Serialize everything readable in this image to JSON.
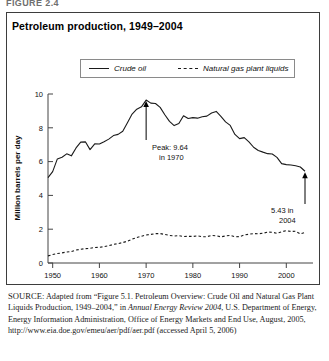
{
  "figure_label": "FIGURE 2.4",
  "chart_title": "Petroleum production, 1949–2004",
  "legend": {
    "items": [
      {
        "label": "Crude oil",
        "style": "solid"
      },
      {
        "label": "Natural gas plant liquids",
        "style": "dashed"
      }
    ]
  },
  "annotations": {
    "peak_line1": "Peak: 9.64",
    "peak_line2": "in 1970",
    "end_line1": "5.43 in",
    "end_line2": "2004"
  },
  "source": {
    "prefix": "SOURCE:",
    "part1": " Adapted from “Figure 5.1. Petroleum Overview: Crude Oil and Natural Gas Plant Liquids Production, 1949–2004,” in ",
    "italic1": "Annual Energy Review 2004",
    "part2": ", U.S. Department of Energy, Energy Information Administration, Office of Energy Markets and End Use, August, 2005, http://www.eia.doe.gov/emeu/aer/pdf/aer.pdf (accessed April 5, 2006)"
  },
  "chart_data": {
    "type": "line",
    "title": "Petroleum production, 1949–2004",
    "xlabel": "",
    "ylabel": "Million barrels per day",
    "xlim": [
      1949,
      2004
    ],
    "ylim": [
      0,
      10
    ],
    "yticks": [
      0,
      2,
      4,
      6,
      8,
      10
    ],
    "xticks": [
      1950,
      1960,
      1970,
      1980,
      1990,
      2000
    ],
    "grid": false,
    "legend_position": "top-center",
    "x": [
      1949,
      1950,
      1951,
      1952,
      1953,
      1954,
      1955,
      1956,
      1957,
      1958,
      1959,
      1960,
      1961,
      1962,
      1963,
      1964,
      1965,
      1966,
      1967,
      1968,
      1969,
      1970,
      1971,
      1972,
      1973,
      1974,
      1975,
      1976,
      1977,
      1978,
      1979,
      1980,
      1981,
      1982,
      1983,
      1984,
      1985,
      1986,
      1987,
      1988,
      1989,
      1990,
      1991,
      1992,
      1993,
      1994,
      1995,
      1996,
      1997,
      1998,
      1999,
      2000,
      2001,
      2002,
      2003,
      2004
    ],
    "series": [
      {
        "name": "Crude oil",
        "style": "solid",
        "values": [
          5.05,
          5.41,
          6.16,
          6.26,
          6.46,
          6.34,
          6.81,
          7.15,
          7.17,
          6.71,
          7.05,
          7.04,
          7.18,
          7.33,
          7.54,
          7.61,
          7.8,
          8.3,
          8.81,
          9.1,
          9.24,
          9.64,
          9.46,
          9.44,
          9.21,
          8.77,
          8.38,
          8.13,
          8.25,
          8.71,
          8.55,
          8.6,
          8.57,
          8.65,
          8.69,
          8.88,
          8.97,
          8.68,
          8.35,
          8.14,
          7.61,
          7.36,
          7.42,
          7.17,
          6.85,
          6.66,
          6.56,
          6.47,
          6.45,
          6.25,
          5.88,
          5.82,
          5.8,
          5.75,
          5.68,
          5.43
        ]
      },
      {
        "name": "Natural gas plant liquids",
        "style": "dashed",
        "values": [
          0.42,
          0.5,
          0.56,
          0.6,
          0.65,
          0.68,
          0.77,
          0.81,
          0.85,
          0.87,
          0.92,
          0.93,
          0.97,
          1.02,
          1.1,
          1.15,
          1.21,
          1.29,
          1.41,
          1.51,
          1.58,
          1.66,
          1.69,
          1.74,
          1.74,
          1.69,
          1.63,
          1.6,
          1.62,
          1.57,
          1.58,
          1.57,
          1.61,
          1.55,
          1.56,
          1.63,
          1.61,
          1.55,
          1.6,
          1.63,
          1.55,
          1.56,
          1.66,
          1.7,
          1.74,
          1.73,
          1.76,
          1.83,
          1.82,
          1.76,
          1.85,
          1.91,
          1.87,
          1.88,
          1.72,
          1.81
        ]
      }
    ],
    "annotations": [
      {
        "text": "Peak: 9.64 in 1970",
        "x": 1970,
        "y": 9.64
      },
      {
        "text": "5.43 in 2004",
        "x": 2004,
        "y": 5.43
      }
    ]
  }
}
